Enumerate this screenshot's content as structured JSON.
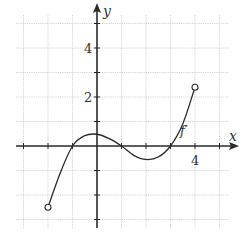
{
  "chart_data": {
    "type": "line",
    "title": "",
    "xlabel": "x",
    "ylabel": "y",
    "series": [
      {
        "name": "f′",
        "label": "f′",
        "x": [
          -2,
          -1.5,
          -1,
          -0.5,
          0,
          0.5,
          1,
          1.5,
          2,
          2.5,
          3,
          3.5,
          4
        ],
        "values": [
          -2.5,
          -1.1,
          0,
          0.42,
          0.48,
          0.3,
          0,
          -0.38,
          -0.55,
          -0.45,
          0,
          0.9,
          2.4
        ]
      }
    ],
    "endpoints": [
      {
        "x": -2,
        "y": -2.5,
        "type": "open"
      },
      {
        "x": 4,
        "y": 2.4,
        "type": "open"
      }
    ],
    "xlim": [
      -3.3,
      5.5
    ],
    "ylim": [
      -3.3,
      5.8
    ],
    "x_tick_labels": [
      {
        "value": 4,
        "label": "4"
      }
    ],
    "y_tick_labels": [
      {
        "value": 2,
        "label": "2"
      },
      {
        "value": 4,
        "label": "4"
      }
    ],
    "grid": true,
    "grid_step": 1,
    "legend": null,
    "annotations": [
      {
        "text": "f′",
        "x": 3.5,
        "y": 0.65
      }
    ]
  },
  "labels": {
    "x_axis": "x",
    "y_axis": "y",
    "curve": "f′",
    "xtick_4": "4",
    "ytick_2": "2",
    "ytick_4": "4"
  },
  "colors": {
    "ink": "#2a2a2a",
    "grid": "#c8c8c8",
    "background": "#ffffff"
  }
}
